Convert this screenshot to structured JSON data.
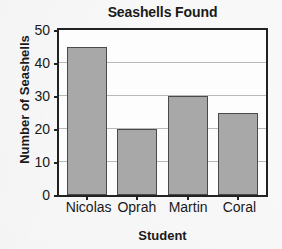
{
  "chart_data": {
    "type": "bar",
    "title": "Seashells Found",
    "xlabel": "Student",
    "ylabel": "Number of Seashells",
    "categories": [
      "Nicolas",
      "Oprah",
      "Martin",
      "Coral"
    ],
    "values": [
      45,
      20,
      30,
      25
    ],
    "ylim": [
      0,
      50
    ],
    "ytick_step": 10,
    "yticks": [
      0,
      10,
      20,
      30,
      40,
      50
    ],
    "ytick_labels": [
      "0",
      "10",
      "20",
      "30",
      "40",
      "50"
    ],
    "grid": true,
    "grid_axis": "y",
    "legend": false,
    "legend_position": "none",
    "colors": {
      "bar_fill": "#a8a8a8",
      "bar_edge": "#4a4a4a",
      "gridline": "#b9b9b9",
      "axis": "#222222",
      "text": "#1a1a1a",
      "plot_background": "#fdfdfd",
      "page_background": "#f8f8f8"
    }
  }
}
